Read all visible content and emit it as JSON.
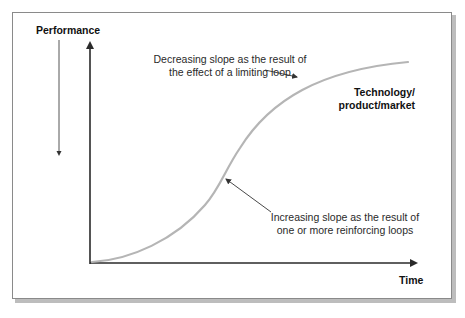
{
  "diagram": {
    "type": "s-curve",
    "axes": {
      "y_label": "Performance",
      "x_label": "Time"
    },
    "curve_label": {
      "line1": "Technology/",
      "line2": "product/market"
    },
    "annotations": [
      {
        "id": "limiting",
        "line1": "Decreasing slope as the result of",
        "line2": "the effect of a limiting loop"
      },
      {
        "id": "reinforcing",
        "line1": "Increasing slope as the result of",
        "line2": "one or more reinforcing loops"
      }
    ],
    "colors": {
      "curve": "#b5b5b5",
      "axis": "#2a2a2a",
      "text": "#2a2a2a",
      "frame": "#8a8a8a",
      "shadow": "#bdbdbd"
    }
  }
}
